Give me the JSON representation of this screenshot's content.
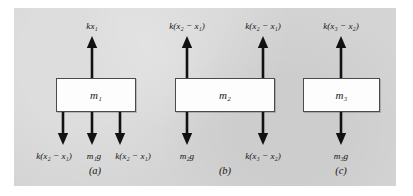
{
  "figure": {
    "panel_color": "#d4d4d4",
    "background_color": "#ffffff",
    "box_fill": "#fdfdfd",
    "box_stroke": "#4a4a4a",
    "arrow_color": "#111111"
  },
  "diagrams": [
    {
      "caption": "(a)",
      "mass_label_k": "m",
      "mass_label_sub": "1",
      "up_forces": [
        {
          "label_k": "kx",
          "label_sub": "1",
          "label_tail": ""
        }
      ],
      "down_forces": [
        {
          "label_k": "k(x",
          "label_sub": "2",
          "label_tail": " − x",
          "label_sub2": "1",
          "label_tail2": ")"
        },
        {
          "label_k": "m",
          "label_sub": "1",
          "label_tail": "g",
          "label_sub2": "",
          "label_tail2": ""
        },
        {
          "label_k": "k(x",
          "label_sub": "2",
          "label_tail": " − x",
          "label_sub2": "1",
          "label_tail2": ")"
        }
      ]
    },
    {
      "caption": "(b)",
      "mass_label_k": "m",
      "mass_label_sub": "2",
      "up_forces": [
        {
          "label_k": "k(x",
          "label_sub": "2",
          "label_tail": " − x",
          "label_sub2": "1",
          "label_tail2": ")"
        },
        {
          "label_k": "k(x",
          "label_sub": "2",
          "label_tail": " − x",
          "label_sub2": "1",
          "label_tail2": ")"
        }
      ],
      "down_forces": [
        {
          "label_k": "m",
          "label_sub": "2",
          "label_tail": "g",
          "label_sub2": "",
          "label_tail2": ""
        },
        {
          "label_k": "k(x",
          "label_sub": "3",
          "label_tail": " − x",
          "label_sub2": "2",
          "label_tail2": ")"
        }
      ]
    },
    {
      "caption": "(c)",
      "mass_label_k": "m",
      "mass_label_sub": "3",
      "up_forces": [
        {
          "label_k": "k(x",
          "label_sub": "3",
          "label_tail": " − x",
          "label_sub2": "2",
          "label_tail2": ")"
        }
      ],
      "down_forces": [
        {
          "label_k": "m",
          "label_sub": "3",
          "label_tail": "g",
          "label_sub2": "",
          "label_tail2": ""
        }
      ]
    }
  ],
  "labels": {
    "a_up_1": "kx₁",
    "a_down_1": "k(x₂ − x₁)",
    "a_down_2": "m₁g",
    "a_down_3": "k(x₂ − x₁)",
    "a_mass": "m₁",
    "a_caption": "(a)",
    "b_up_1": "k(x₂ − x₁)",
    "b_up_2": "k(x₂ − x₁)",
    "b_down_1": "m₂g",
    "b_down_2": "k(x₃ − x₂)",
    "b_mass": "m₂",
    "b_caption": "(b)",
    "c_up_1": "k(x₃ − x₂)",
    "c_down_1": "m₃g",
    "c_mass": "m₃",
    "c_caption": "(c)"
  }
}
